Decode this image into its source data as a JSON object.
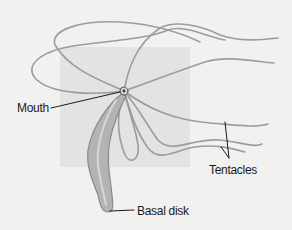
{
  "diagram": {
    "colors": {
      "background": "#f1f1f0",
      "backdrop_square": "#e2e2e1",
      "tentacle": "#9a9a9a",
      "body": "#a8a8a8",
      "leader_line": "#1a1a1a",
      "text": "#1a1a1a"
    },
    "labels": {
      "mouth": "Mouth",
      "tentacles": "Tentacles",
      "basal_disk": "Basal disk"
    }
  }
}
